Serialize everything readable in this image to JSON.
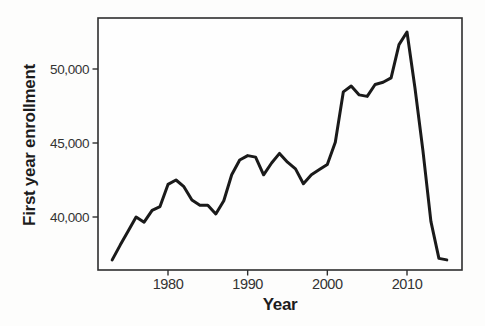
{
  "chart_data": {
    "type": "line",
    "title": "",
    "xlabel": "Year",
    "ylabel": "First year enrollment",
    "x": [
      1973,
      1974,
      1975,
      1976,
      1977,
      1978,
      1979,
      1980,
      1981,
      1982,
      1983,
      1984,
      1985,
      1986,
      1987,
      1988,
      1989,
      1990,
      1991,
      1992,
      1993,
      1994,
      1995,
      1996,
      1997,
      1998,
      1999,
      2000,
      2001,
      2002,
      2003,
      2004,
      2005,
      2006,
      2007,
      2008,
      2009,
      2010,
      2011,
      2012,
      2013,
      2014,
      2015
    ],
    "values": [
      37100,
      38100,
      39050,
      40000,
      39650,
      40450,
      40700,
      42200,
      42500,
      42050,
      41150,
      40800,
      40800,
      40200,
      41100,
      42850,
      43850,
      44150,
      44050,
      42850,
      43650,
      44300,
      43700,
      43250,
      42250,
      42850,
      43200,
      43550,
      45050,
      48450,
      48850,
      48250,
      48150,
      48950,
      49100,
      49400,
      51650,
      52500,
      48700,
      44500,
      39700,
      37200,
      37100
    ],
    "xticks": [
      {
        "value": 1980,
        "label": "1980"
      },
      {
        "value": 1990,
        "label": "1990"
      },
      {
        "value": 2000,
        "label": "2000"
      },
      {
        "value": 2010,
        "label": "2010"
      }
    ],
    "yticks": [
      {
        "value": 40000,
        "label": "40,000"
      },
      {
        "value": 45000,
        "label": "45,000"
      },
      {
        "value": 50000,
        "label": "50,000"
      }
    ],
    "xlim": [
      1971.2,
      2016.9
    ],
    "ylim": [
      36400,
      53450
    ],
    "grid": false,
    "legend": "none",
    "line_color": "#1a1a1a",
    "border_color": "#2e2e2e",
    "text_color": "#333333"
  }
}
